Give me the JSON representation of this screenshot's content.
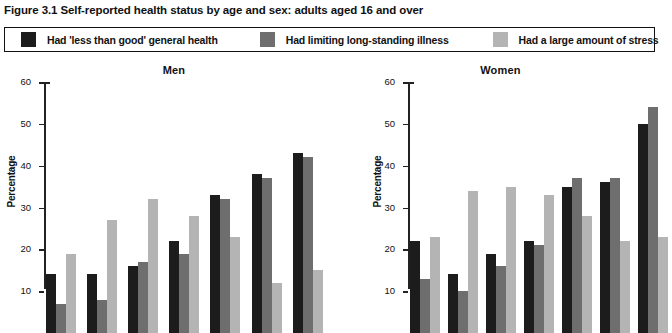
{
  "figure": {
    "title": "Figure 3.1 Self-reported health status by age and sex: adults aged 16 and over"
  },
  "legend": {
    "items": [
      {
        "label": "Had 'less than good' general health",
        "color": "#1c1c1c",
        "key": "less-than-good-health"
      },
      {
        "label": "Had limiting long-standing illness",
        "color": "#6e6e6e",
        "key": "limiting-long-standing-illness"
      },
      {
        "label": "Had a large amount of stress",
        "color": "#b4b4b4",
        "key": "large-amount-of-stress"
      }
    ]
  },
  "axis": {
    "y_label": "Percentage",
    "ticks": [
      "60",
      "50",
      "40",
      "30",
      "20",
      "10"
    ]
  },
  "panels": [
    {
      "key": "men",
      "title": "Men"
    },
    {
      "key": "women",
      "title": "Women"
    }
  ],
  "chart_data": [
    {
      "type": "bar",
      "title": "Men",
      "xlabel": "",
      "ylabel": "Percentage",
      "ylim": [
        0,
        60
      ],
      "yticks": [
        10,
        20,
        30,
        40,
        50,
        60
      ],
      "grid": false,
      "legend_position": "top",
      "categories": [
        "16-24",
        "25-34",
        "35-44",
        "45-54",
        "55-64",
        "65-74",
        "75 and over"
      ],
      "series": [
        {
          "name": "Had 'less than good' general health",
          "color": "#1c1c1c",
          "values": [
            14,
            14,
            16,
            22,
            33,
            38,
            43
          ]
        },
        {
          "name": "Had limiting long-standing illness",
          "color": "#6e6e6e",
          "values": [
            7,
            8,
            17,
            19,
            32,
            37,
            42
          ]
        },
        {
          "name": "Had a large amount of stress",
          "color": "#b4b4b4",
          "values": [
            19,
            27,
            32,
            28,
            23,
            12,
            15
          ]
        }
      ]
    },
    {
      "type": "bar",
      "title": "Women",
      "xlabel": "",
      "ylabel": "Percentage",
      "ylim": [
        0,
        60
      ],
      "yticks": [
        10,
        20,
        30,
        40,
        50,
        60
      ],
      "grid": false,
      "legend_position": "top",
      "categories": [
        "16-24",
        "25-34",
        "35-44",
        "45-54",
        "55-64",
        "65-74",
        "75 and over"
      ],
      "series": [
        {
          "name": "Had 'less than good' general health",
          "color": "#1c1c1c",
          "values": [
            22,
            14,
            19,
            22,
            35,
            36,
            50
          ]
        },
        {
          "name": "Had limiting long-standing illness",
          "color": "#6e6e6e",
          "values": [
            13,
            10,
            16,
            21,
            37,
            37,
            54
          ]
        },
        {
          "name": "Had a large amount of stress",
          "color": "#b4b4b4",
          "values": [
            23,
            34,
            35,
            33,
            28,
            22,
            23
          ]
        }
      ]
    }
  ]
}
